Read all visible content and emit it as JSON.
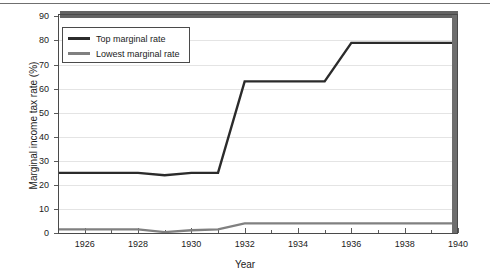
{
  "chart_data": {
    "type": "line",
    "title": "",
    "xlabel": "Year",
    "ylabel": "Marginal income tax rate (%)",
    "xlim": [
      1925,
      1940
    ],
    "ylim": [
      0,
      91
    ],
    "xticks": [
      1926,
      1928,
      1930,
      1932,
      1934,
      1936,
      1938,
      1940
    ],
    "xtick_labels": [
      "1926",
      "1928",
      "1930",
      "1932",
      "1934",
      "1936",
      "1938",
      "1940"
    ],
    "xminor_ticks": [
      1925,
      1927,
      1929,
      1931,
      1933,
      1935,
      1937,
      1939
    ],
    "yticks": [
      0,
      10,
      20,
      30,
      40,
      50,
      60,
      70,
      80,
      90
    ],
    "ytick_labels": [
      "0",
      "10",
      "20",
      "30",
      "40",
      "50",
      "60",
      "70",
      "80",
      "90"
    ],
    "grid": "horizontal",
    "legend_position": "upper-left",
    "x": [
      1925,
      1926,
      1927,
      1928,
      1929,
      1930,
      1931,
      1932,
      1933,
      1934,
      1935,
      1936,
      1937,
      1938,
      1939,
      1940
    ],
    "series": [
      {
        "name": "Top marginal rate",
        "color": "#2b2b2b",
        "values": [
          25,
          25,
          25,
          25,
          24,
          25,
          25,
          63,
          63,
          63,
          63,
          79,
          79,
          79,
          79,
          79
        ]
      },
      {
        "name": "Lowest marginal rate",
        "color": "#808080",
        "values": [
          1.5,
          1.5,
          1.5,
          1.5,
          0.375,
          1.125,
          1.5,
          4,
          4,
          4,
          4,
          4,
          4,
          4,
          4,
          4
        ]
      }
    ],
    "annotations": [
      {
        "name": "top-clipped-band",
        "description": "thick grey horizontal band clipped at top of plot area near 91%",
        "color": "#646464",
        "y": 91
      },
      {
        "name": "right-edge-band",
        "description": "thick grey vertical band along right plot edge at 1940",
        "color": "#6e6e6e",
        "x": 1940
      }
    ]
  },
  "axis": {
    "x_title": "Year",
    "y_title": "Marginal income tax rate (%)"
  },
  "legend": {
    "items": [
      {
        "label": "Top marginal rate",
        "color": "#2b2b2b"
      },
      {
        "label": "Lowest marginal rate",
        "color": "#808080"
      }
    ]
  },
  "colors": {
    "top_line": "#2b2b2b",
    "lowest_line": "#808080",
    "axis": "#4a4a4a",
    "grid": "#e2e2e2",
    "text": "#1b1b1b",
    "background": "#ffffff"
  }
}
